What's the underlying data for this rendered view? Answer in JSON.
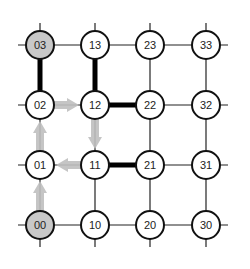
{
  "diagram": {
    "type": "grid-network",
    "columns_x": [
      40,
      95,
      150,
      206
    ],
    "rows_y": [
      225,
      165,
      105,
      45
    ],
    "node_radius": 14,
    "colors": {
      "edge": "#222222",
      "thick_edge": "#000000",
      "node_fill": "#ffffff",
      "node_fill_highlight": "#c8c8c8",
      "node_stroke": "#111111",
      "path_arrow": "#bfbfbf"
    },
    "nodes": [
      {
        "id": "00",
        "col": 0,
        "row": 0,
        "label": "00",
        "highlight": true
      },
      {
        "id": "01",
        "col": 0,
        "row": 1,
        "label": "01",
        "highlight": false
      },
      {
        "id": "02",
        "col": 0,
        "row": 2,
        "label": "02",
        "highlight": false
      },
      {
        "id": "03",
        "col": 0,
        "row": 3,
        "label": "03",
        "highlight": true
      },
      {
        "id": "10",
        "col": 1,
        "row": 0,
        "label": "10",
        "highlight": false
      },
      {
        "id": "11",
        "col": 1,
        "row": 1,
        "label": "11",
        "highlight": false
      },
      {
        "id": "12",
        "col": 1,
        "row": 2,
        "label": "12",
        "highlight": false
      },
      {
        "id": "13",
        "col": 1,
        "row": 3,
        "label": "13",
        "highlight": false
      },
      {
        "id": "20",
        "col": 2,
        "row": 0,
        "label": "20",
        "highlight": false
      },
      {
        "id": "21",
        "col": 2,
        "row": 1,
        "label": "21",
        "highlight": false
      },
      {
        "id": "22",
        "col": 2,
        "row": 2,
        "label": "22",
        "highlight": false
      },
      {
        "id": "23",
        "col": 2,
        "row": 3,
        "label": "23",
        "highlight": false
      },
      {
        "id": "30",
        "col": 3,
        "row": 0,
        "label": "30",
        "highlight": false
      },
      {
        "id": "31",
        "col": 3,
        "row": 1,
        "label": "31",
        "highlight": false
      },
      {
        "id": "32",
        "col": 3,
        "row": 2,
        "label": "32",
        "highlight": false
      },
      {
        "id": "33",
        "col": 3,
        "row": 3,
        "label": "33",
        "highlight": false
      }
    ],
    "thick_edges": [
      [
        "03",
        "02"
      ],
      [
        "13",
        "12"
      ],
      [
        "12",
        "22"
      ],
      [
        "11",
        "21"
      ]
    ],
    "path_arrows": [
      [
        "00",
        "01"
      ],
      [
        "01",
        "02"
      ],
      [
        "02",
        "12"
      ],
      [
        "12",
        "11"
      ],
      [
        "11",
        "01"
      ]
    ]
  }
}
